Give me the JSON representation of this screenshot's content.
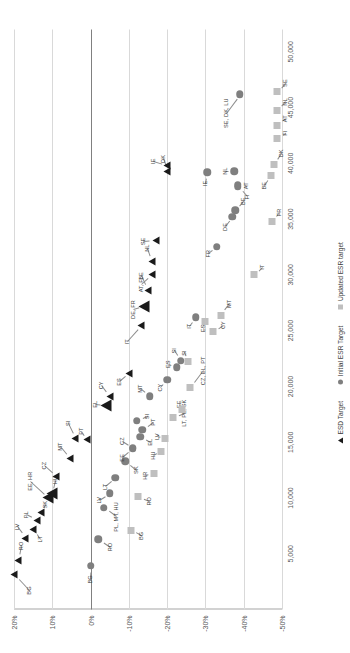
{
  "chart_data": {
    "type": "scatter",
    "title": "",
    "xlabel": "",
    "ylabel": "",
    "xlim": [
      0,
      52000
    ],
    "ylim": [
      -0.5,
      0.2
    ],
    "grid": true,
    "legend_position": "bottom-center",
    "xticks": [
      "5,000",
      "10,000",
      "15,000",
      "20,000",
      "25,000",
      "30,000",
      "35,000",
      "40,000",
      "45,000",
      "50,000"
    ],
    "xtick_values": [
      5000,
      10000,
      15000,
      20000,
      25000,
      30000,
      35000,
      40000,
      45000,
      50000
    ],
    "yticks": [
      "20%",
      "10%",
      "0%",
      "-10%",
      "-20%",
      "-30%",
      "-40%",
      "-50%"
    ],
    "ytick_values": [
      0.2,
      0.1,
      0.0,
      -0.1,
      -0.2,
      -0.3,
      -0.4,
      -0.5
    ],
    "series": [
      {
        "name": "ESD Target",
        "marker": "triangle",
        "color": "#1a1a1a",
        "points": [
          {
            "label": "BG",
            "x": 3100,
            "y": 0.2,
            "lx": 1700,
            "ly": 0.162,
            "big": false
          },
          {
            "label": "RO",
            "x": 4400,
            "y": 0.19,
            "lx": 5700,
            "ly": 0.183,
            "big": false
          },
          {
            "label": "LV",
            "x": 6400,
            "y": 0.17,
            "lx": 7400,
            "ly": 0.192,
            "big": false
          },
          {
            "label": "LT",
            "x": 7200,
            "y": 0.15,
            "lx": 6300,
            "ly": 0.133,
            "big": false
          },
          {
            "label": "PL",
            "x": 8000,
            "y": 0.14,
            "lx": 8500,
            "ly": 0.168,
            "big": false
          },
          {
            "label": "SK",
            "x": 8700,
            "y": 0.13,
            "lx": 9400,
            "ly": 0.119,
            "big": false
          },
          {
            "label": "EE, HR",
            "x": 10000,
            "y": 0.11,
            "lx": 11500,
            "ly": 0.157,
            "big": true
          },
          {
            "label": "HU",
            "x": 10400,
            "y": 0.1,
            "lx": 11600,
            "ly": 0.092,
            "big": true
          },
          {
            "label": "CZ",
            "x": 11900,
            "y": 0.09,
            "lx": 12900,
            "ly": 0.122,
            "big": false
          },
          {
            "label": "MT",
            "x": 13500,
            "y": 0.055,
            "lx": 14600,
            "ly": 0.081,
            "big": false
          },
          {
            "label": "SI",
            "x": 15300,
            "y": 0.04,
            "lx": 16700,
            "ly": 0.06,
            "big": false
          },
          {
            "label": "PT",
            "x": 15200,
            "y": 0.01,
            "lx": 16000,
            "ly": 0.025,
            "big": false
          },
          {
            "label": "EL",
            "x": 18300,
            "y": -0.04,
            "lx": 18400,
            "ly": -0.012,
            "big": true
          },
          {
            "label": "CY",
            "x": 19100,
            "y": -0.05,
            "lx": 20100,
            "ly": -0.028,
            "big": false
          },
          {
            "label": "ES",
            "x": 21200,
            "y": -0.1,
            "lx": 20400,
            "ly": -0.073,
            "big": false
          },
          {
            "label": "IT",
            "x": 25500,
            "y": -0.133,
            "lx": 24000,
            "ly": -0.094,
            "big": false
          },
          {
            "label": "DE, FR",
            "x": 27200,
            "y": -0.14,
            "lx": 26900,
            "ly": -0.11,
            "big": true
          },
          {
            "label": "BE",
            "x": 28600,
            "y": -0.15,
            "lx": 29900,
            "ly": -0.133,
            "big": false
          },
          {
            "label": "AT, FI",
            "x": 30000,
            "y": -0.16,
            "lx": 29100,
            "ly": -0.131,
            "big": false
          },
          {
            "label": "NL",
            "x": 31200,
            "y": -0.16,
            "lx": 32400,
            "ly": -0.148,
            "big": false
          },
          {
            "label": "SE",
            "x": 33100,
            "y": -0.17,
            "lx": 33000,
            "ly": -0.138,
            "big": false
          },
          {
            "label": "DK",
            "x": 39300,
            "y": -0.2,
            "lx": 40400,
            "ly": -0.188,
            "big": false
          },
          {
            "label": "IE",
            "x": 39800,
            "y": -0.2,
            "lx": 40200,
            "ly": -0.162,
            "big": false
          }
        ]
      },
      {
        "name": "Initial ESR Target",
        "marker": "circle",
        "color": "#7f7f7f",
        "points": [
          {
            "label": "BG",
            "x": 3900,
            "y": 0.0,
            "lx": 2700,
            "ly": 0.002
          },
          {
            "label": "RO",
            "x": 6300,
            "y": -0.02,
            "lx": 5600,
            "ly": -0.05
          },
          {
            "label": "PL, MT, HU",
            "x": 9100,
            "y": -0.035,
            "lx": 8300,
            "ly": -0.066
          },
          {
            "label": "LV",
            "x": 10400,
            "y": -0.05,
            "lx": 9800,
            "ly": -0.022
          },
          {
            "label": "LT",
            "x": 11800,
            "y": -0.065,
            "lx": 11000,
            "ly": -0.037
          },
          {
            "label": "SK",
            "x": 13300,
            "y": -0.09,
            "lx": 12500,
            "ly": -0.118
          },
          {
            "label": "EE",
            "x": 14400,
            "y": -0.11,
            "lx": 13600,
            "ly": -0.083
          },
          {
            "label": "CZ",
            "x": 14500,
            "y": -0.11,
            "lx": 15100,
            "ly": -0.082
          },
          {
            "label": "EL",
            "x": 15500,
            "y": -0.13,
            "lx": 15000,
            "ly": -0.155
          },
          {
            "label": "PT",
            "x": 16100,
            "y": -0.135,
            "lx": 16800,
            "ly": -0.162
          },
          {
            "label": "SI",
            "x": 16900,
            "y": -0.12,
            "lx": 17300,
            "ly": -0.147
          },
          {
            "label": "MT",
            "x": 19100,
            "y": -0.155,
            "lx": 19800,
            "ly": -0.13
          },
          {
            "label": "CY",
            "x": 20600,
            "y": -0.2,
            "lx": 19900,
            "ly": -0.182
          },
          {
            "label": "ES",
            "x": 21700,
            "y": -0.225,
            "lx": 22000,
            "ly": -0.202
          },
          {
            "label": "SI",
            "x": 22300,
            "y": -0.235,
            "lx": 23200,
            "ly": -0.218
          },
          {
            "label": "IT",
            "x": 26200,
            "y": -0.275,
            "lx": 25400,
            "ly": -0.258
          },
          {
            "label": "FR",
            "x": 32500,
            "y": -0.33,
            "lx": 31900,
            "ly": -0.307
          },
          {
            "label": "DE",
            "x": 35200,
            "y": -0.37,
            "lx": 34300,
            "ly": -0.35
          },
          {
            "label": "BE",
            "x": 35800,
            "y": -0.378,
            "lx": 36600,
            "ly": -0.398
          },
          {
            "label": "FI",
            "x": 37900,
            "y": -0.385,
            "lx": 37000,
            "ly": -0.408
          },
          {
            "label": "AT",
            "x": 38100,
            "y": -0.385,
            "lx": 38000,
            "ly": -0.406
          },
          {
            "label": "IE",
            "x": 39200,
            "y": -0.305,
            "lx": 38200,
            "ly": -0.3
          },
          {
            "label": "NL",
            "x": 39300,
            "y": -0.375,
            "lx": 39300,
            "ly": -0.352
          },
          {
            "label": "SE, DK, LU",
            "x": 46200,
            "y": -0.39,
            "lx": 44500,
            "ly": -0.353
          }
        ]
      },
      {
        "name": "Updated ESR target",
        "marker": "square",
        "color": "#bfbfbf",
        "points": [
          {
            "label": "BG",
            "x": 7100,
            "y": -0.105,
            "lx": 6600,
            "ly": -0.132
          },
          {
            "label": "RO",
            "x": 10100,
            "y": -0.125,
            "lx": 9700,
            "ly": -0.153
          },
          {
            "label": "HR",
            "x": 12200,
            "y": -0.165,
            "lx": 12000,
            "ly": -0.143
          },
          {
            "label": "HU",
            "x": 14200,
            "y": -0.185,
            "lx": 13800,
            "ly": -0.163
          },
          {
            "label": "LV",
            "x": 15300,
            "y": -0.195,
            "lx": 15500,
            "ly": -0.173
          },
          {
            "label": "LT, PL, SK",
            "x": 17200,
            "y": -0.215,
            "lx": 17600,
            "ly": -0.243
          },
          {
            "label": "EE",
            "x": 17900,
            "y": -0.24,
            "lx": 18400,
            "ly": -0.23
          },
          {
            "label": "CZ, EL, PT",
            "x": 19900,
            "y": -0.26,
            "lx": 21400,
            "ly": -0.293
          },
          {
            "label": "SI",
            "x": 22200,
            "y": -0.255,
            "lx": 23000,
            "ly": -0.245
          },
          {
            "label": "CY",
            "x": 24900,
            "y": -0.32,
            "lx": 25500,
            "ly": -0.345
          },
          {
            "label": "MT",
            "x": 26400,
            "y": -0.34,
            "lx": 27400,
            "ly": -0.362
          },
          {
            "label": "ES",
            "x": 25800,
            "y": -0.3,
            "lx": 25200,
            "ly": -0.293
          },
          {
            "label": "IT",
            "x": 30000,
            "y": -0.428,
            "lx": 30700,
            "ly": -0.447
          },
          {
            "label": "FR",
            "x": 34800,
            "y": -0.475,
            "lx": 35600,
            "ly": -0.492
          },
          {
            "label": "BE",
            "x": 38900,
            "y": -0.47,
            "lx": 38000,
            "ly": -0.452
          },
          {
            "label": "DK",
            "x": 39900,
            "y": -0.478,
            "lx": 40900,
            "ly": -0.497
          },
          {
            "label": "FI",
            "x": 42200,
            "y": -0.488,
            "lx": 42700,
            "ly": -0.507
          },
          {
            "label": "AT",
            "x": 43400,
            "y": -0.488,
            "lx": 44000,
            "ly": -0.507
          },
          {
            "label": "NL",
            "x": 44700,
            "y": -0.488,
            "lx": 45500,
            "ly": -0.507
          },
          {
            "label": "SE",
            "x": 46400,
            "y": -0.488,
            "lx": 47200,
            "ly": -0.507
          }
        ]
      }
    ]
  },
  "legend": {
    "items": [
      {
        "label": "ESD Target",
        "marker": "triangle"
      },
      {
        "label": "Initial ESR Target",
        "marker": "circle"
      },
      {
        "label": "Updated ESR target",
        "marker": "square"
      }
    ]
  }
}
